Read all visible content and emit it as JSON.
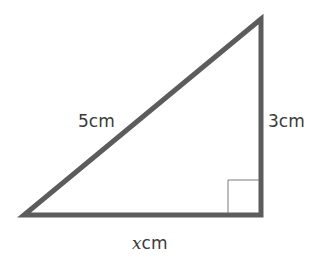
{
  "diagram": {
    "type": "right-triangle",
    "colors": {
      "stroke": "#5c5c5c",
      "right_angle_marker": "#7a7a7a",
      "text": "#3a3a3a",
      "background": "#ffffff"
    },
    "vertices": {
      "top": [
        261,
        19
      ],
      "bottom_left": [
        24,
        215
      ],
      "bottom_right": [
        261,
        215
      ]
    },
    "right_angle": {
      "corner": "bottom_right",
      "size": 32
    },
    "labels": {
      "hypotenuse": {
        "value": "5",
        "unit": "cm"
      },
      "vertical_side": {
        "value": "3",
        "unit": "cm"
      },
      "horizontal_side": {
        "value": "x",
        "unit": "cm"
      }
    }
  }
}
